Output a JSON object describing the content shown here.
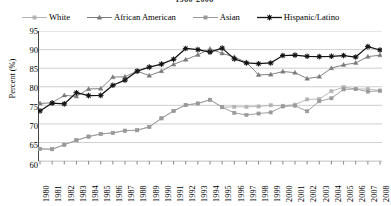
{
  "chart_data": {
    "type": "line",
    "title": "1980-2008",
    "xlabel": "",
    "ylabel": "Percent (%)",
    "ylim": [
      60,
      95
    ],
    "ytick_step": 5,
    "yticks": [
      95,
      90,
      85,
      80,
      75,
      70,
      65,
      60
    ],
    "grid": true,
    "legend_position": "top",
    "categories": [
      "1980",
      "1981",
      "1982",
      "1983",
      "1984",
      "1985",
      "1986",
      "1987",
      "1988",
      "1989",
      "1990",
      "1991",
      "1992",
      "1993",
      "1994",
      "1995",
      "1996",
      "1997",
      "1998",
      "1999",
      "2000",
      "2001",
      "2002",
      "2003",
      "2004",
      "2005",
      "2006",
      "2007",
      "2008"
    ],
    "series": [
      {
        "name": "White",
        "color": "#b3b3b3",
        "marker": "square",
        "values": [
          63.3,
          63.2,
          64.4,
          65.6,
          66.6,
          67.3,
          67.6,
          68.2,
          68.3,
          69.2,
          71.5,
          73.5,
          75.1,
          75.5,
          76.5,
          74.5,
          74.6,
          74.6,
          74.7,
          75.0,
          74.9,
          75.2,
          76.6,
          76.7,
          78.8,
          79.9,
          79.4,
          79.4,
          79.0
        ]
      },
      {
        "name": "African American",
        "color": "#7a7a7a",
        "marker": "triangle",
        "values": [
          75.5,
          75.7,
          77.7,
          77.4,
          79.4,
          79.5,
          82.6,
          82.7,
          84.2,
          83.0,
          84.2,
          86.0,
          87.3,
          88.6,
          90.2,
          89.0,
          88.0,
          86.6,
          83.2,
          83.3,
          84.1,
          83.8,
          82.2,
          82.7,
          85.0,
          85.9,
          86.4,
          88.1,
          88.5
        ]
      },
      {
        "name": "Asian",
        "color": "#999999",
        "marker": "square",
        "values": [
          63.3,
          63.2,
          64.4,
          65.6,
          66.6,
          67.3,
          67.6,
          68.2,
          68.3,
          69.2,
          71.5,
          73.5,
          75.1,
          75.5,
          76.5,
          74.5,
          73.0,
          72.4,
          72.8,
          73.1,
          74.7,
          74.9,
          73.4,
          76.1,
          76.9,
          79.3,
          79.4,
          78.7,
          78.9
        ]
      },
      {
        "name": "Hispanic/Latino",
        "color": "#141414",
        "marker": "star",
        "values": [
          73.5,
          75.6,
          75.4,
          78.4,
          77.6,
          77.7,
          80.4,
          81.8,
          84.2,
          85.3,
          86.1,
          87.4,
          90.3,
          90.0,
          89.3,
          90.4,
          87.5,
          86.4,
          86.2,
          86.4,
          88.4,
          88.5,
          88.2,
          88.1,
          88.2,
          88.4,
          88.0,
          90.8,
          89.9
        ]
      }
    ]
  },
  "legend": {
    "items": [
      {
        "label": "White",
        "icon": "square-marker-icon"
      },
      {
        "label": "African American",
        "icon": "triangle-marker-icon"
      },
      {
        "label": "Asian",
        "icon": "square-marker-icon"
      },
      {
        "label": "Hispanic/Latino",
        "icon": "star-marker-icon"
      }
    ]
  }
}
